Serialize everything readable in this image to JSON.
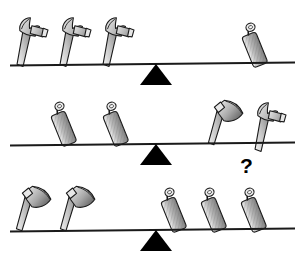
{
  "puzzle": {
    "title": "Balance scale tool weight puzzle",
    "type": "balance-puzzle",
    "background_color": "#ffffff",
    "line_color": "#1a1a1a",
    "fulcrum_color": "#000000",
    "tool_fill_light": "#d9d9d9",
    "tool_fill_mid": "#a6a6a6",
    "tool_fill_dark": "#6e6e6e",
    "tool_outline": "#1a1a1a",
    "question_mark": "?",
    "rows": [
      {
        "id": "row-0",
        "name": "first-balance",
        "state": "balanced",
        "beam": {
          "x": 10,
          "y": 63,
          "width": 285,
          "height": 2,
          "tilt_deg": -0.6
        },
        "fulcrum": {
          "x": 140,
          "y": 64
        },
        "left_side": {
          "label": "three-hammers",
          "count": 3,
          "item": "hammer",
          "items": [
            {
              "icon": "hammer-icon",
              "x": 14,
              "y": 14,
              "scale": 1.0,
              "rot": -18
            },
            {
              "icon": "hammer-icon",
              "x": 57,
              "y": 14,
              "scale": 1.0,
              "rot": -18
            },
            {
              "icon": "hammer-icon",
              "x": 100,
              "y": 14,
              "scale": 1.0,
              "rot": -18
            }
          ]
        },
        "right_side": {
          "label": "one-rolling-pin",
          "count": 1,
          "item": "rolling-pin",
          "items": [
            {
              "icon": "rolling-pin-icon",
              "x": 249,
              "y": 20,
              "scale": 1.0,
              "rot": -22
            }
          ]
        }
      },
      {
        "id": "row-1",
        "name": "second-balance",
        "state": "balanced",
        "beam": {
          "x": 10,
          "y": 57,
          "width": 285,
          "height": 2,
          "tilt_deg": -0.6
        },
        "fulcrum": {
          "x": 140,
          "y": 58
        },
        "left_side": {
          "label": "two-rolling-pins",
          "count": 2,
          "item": "rolling-pin",
          "items": [
            {
              "icon": "rolling-pin-icon",
              "x": 58,
              "y": 13,
              "scale": 1.0,
              "rot": -22
            },
            {
              "icon": "rolling-pin-icon",
              "x": 110,
              "y": 13,
              "scale": 1.0,
              "rot": -22
            }
          ]
        },
        "right_side": {
          "label": "axe-and-hammer",
          "count": 2,
          "items": [
            {
              "icon": "axe-icon",
              "x": 208,
              "y": 10,
              "scale": 1.0,
              "rot": -10
            },
            {
              "icon": "hammer-icon",
              "x": 252,
              "y": 13,
              "scale": 1.0,
              "rot": -18
            }
          ]
        }
      },
      {
        "id": "row-2",
        "name": "third-balance",
        "state": "balanced",
        "beam": {
          "x": 10,
          "y": 63,
          "width": 285,
          "height": 2,
          "tilt_deg": -0.6
        },
        "fulcrum": {
          "x": 140,
          "y": 64
        },
        "left_side": {
          "label": "two-axes",
          "count": 2,
          "item": "axe",
          "items": [
            {
              "icon": "axe-icon",
              "x": 16,
              "y": 16,
              "scale": 1.0,
              "rot": -10
            },
            {
              "icon": "axe-icon",
              "x": 60,
              "y": 16,
              "scale": 1.0,
              "rot": -10
            }
          ]
        },
        "right_side": {
          "label": "three-rolling-pins",
          "count": 3,
          "item": "rolling-pin",
          "items": [
            {
              "icon": "rolling-pin-icon",
              "x": 168,
              "y": 19,
              "scale": 1.0,
              "rot": -22
            },
            {
              "icon": "rolling-pin-icon",
              "x": 208,
              "y": 19,
              "scale": 1.0,
              "rot": -22
            },
            {
              "icon": "rolling-pin-icon",
              "x": 248,
              "y": 19,
              "scale": 1.0,
              "rot": -22
            }
          ]
        },
        "question": {
          "x": 240,
          "y": 155
        }
      }
    ]
  }
}
